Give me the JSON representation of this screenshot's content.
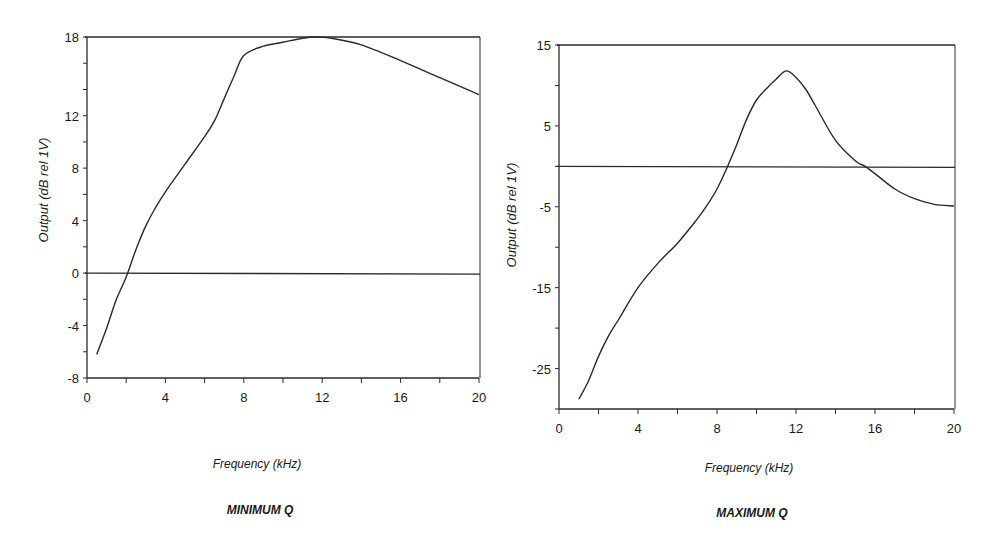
{
  "chart_data": [
    {
      "type": "line",
      "title": "MINIMUM Q",
      "xlabel": "Frequency (kHz)",
      "ylabel": "Output (dB rel 1V)",
      "xlim": [
        0,
        20
      ],
      "ylim": [
        -8,
        18
      ],
      "x_ticks": [
        0,
        4,
        8,
        12,
        16,
        20
      ],
      "y_ticks": [
        -8,
        -4,
        0,
        4,
        8,
        12,
        16,
        18
      ],
      "y_tick_labels": [
        "-8",
        "-4",
        "0",
        "4",
        "8",
        "12",
        "18"
      ],
      "x_tick_labels": [
        "0",
        "4",
        "8",
        "12",
        "16",
        "20"
      ],
      "reference_lines": [
        0,
        18
      ],
      "grid": false,
      "series": [
        {
          "name": "Minimum Q response",
          "x": [
            0.5,
            1,
            1.5,
            2,
            2.5,
            3,
            3.5,
            4,
            5,
            6,
            6.5,
            7,
            7.5,
            8,
            9,
            10,
            11,
            11.7,
            12.5,
            14,
            16,
            18,
            20
          ],
          "y": [
            -6.2,
            -4.2,
            -2.0,
            -0.3,
            1.8,
            3.6,
            5.0,
            6.2,
            8.3,
            10.4,
            11.6,
            13.3,
            15.0,
            16.6,
            17.3,
            17.6,
            17.9,
            18.0,
            17.9,
            17.4,
            16.2,
            14.9,
            13.6
          ]
        }
      ]
    },
    {
      "type": "line",
      "title": "MAXIMUM Q",
      "xlabel": "Frequency (kHz)",
      "ylabel": "Output (dB rel 1V)",
      "xlim": [
        0,
        20
      ],
      "ylim": [
        -30,
        15
      ],
      "x_ticks": [
        0,
        2,
        4,
        6,
        8,
        10,
        12,
        14,
        16,
        18,
        20
      ],
      "x_tick_labels": [
        "0",
        "4",
        "8",
        "12",
        "16",
        "20"
      ],
      "y_ticks": [
        -30,
        -25,
        -20,
        -15,
        -10,
        -5,
        0,
        5,
        10,
        15
      ],
      "y_tick_labels": [
        "-25",
        "-15",
        "-5",
        "5",
        "15"
      ],
      "reference_lines": [
        0,
        15
      ],
      "grid": false,
      "series": [
        {
          "name": "Maximum Q response",
          "x": [
            1,
            1.5,
            2,
            2.5,
            3,
            4,
            5,
            6,
            7,
            7.5,
            8,
            8.5,
            9,
            9.5,
            10,
            10.5,
            11,
            11.5,
            12,
            12.5,
            13,
            14,
            15,
            15.5,
            16,
            17,
            18,
            19,
            20
          ],
          "y": [
            -28.8,
            -26.5,
            -23.5,
            -21.0,
            -19.0,
            -15.0,
            -12.0,
            -9.5,
            -6.5,
            -4.8,
            -2.8,
            -0.2,
            2.7,
            5.8,
            8.2,
            9.6,
            10.8,
            11.8,
            11.0,
            9.5,
            7.4,
            3.2,
            0.7,
            0.0,
            -0.9,
            -2.8,
            -4.0,
            -4.7,
            -4.9
          ]
        }
      ]
    }
  ],
  "charts": [
    {
      "xlabel": "Frequency (kHz)",
      "subtitle": "MINIMUM Q",
      "ylabel": "Output (dB rel 1V)"
    },
    {
      "xlabel": "Frequency (kHz)",
      "subtitle": "MAXIMUM Q",
      "ylabel": "Output (dB rel 1V)"
    }
  ],
  "colors": {
    "line": "#2a2a2a",
    "axis": "#2a2a2a",
    "background": "#ffffff"
  }
}
